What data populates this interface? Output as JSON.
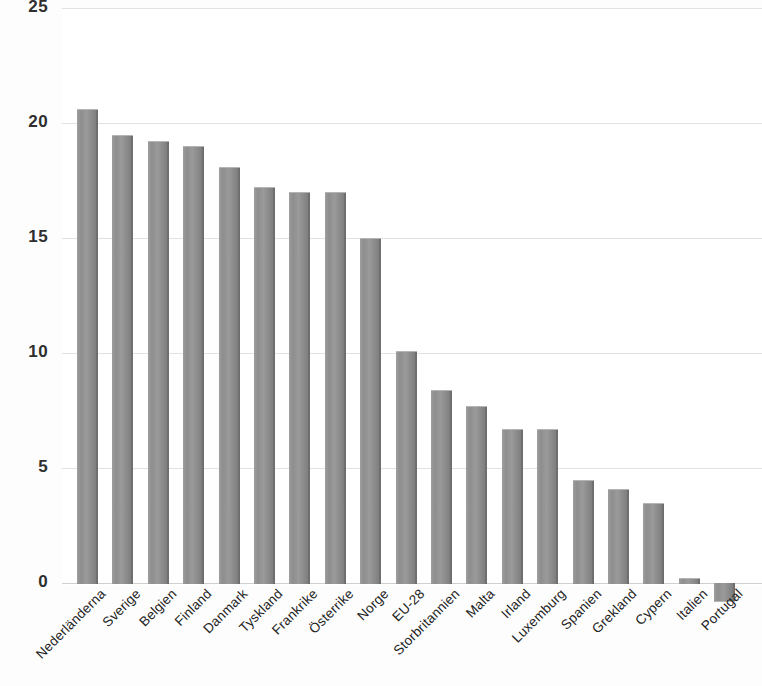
{
  "chart_data": {
    "type": "bar",
    "title": "",
    "subtitle": "",
    "xlabel": "",
    "ylabel": "",
    "ylim": [
      -2.5,
      25
    ],
    "yticks": [
      0,
      5,
      10,
      15,
      20,
      25
    ],
    "ytick_labels": [
      "0",
      "5",
      "10",
      "15",
      "20",
      "25"
    ],
    "grid": true,
    "legend": false,
    "legend_position": "none",
    "bar_color": "#8e8e8e",
    "gridline_color": "#e2e2e2",
    "categories": [
      "Nederländerna",
      "Sverige",
      "Belgien",
      "Finland",
      "Danmark",
      "Tyskland",
      "Frankrike",
      "Österrike",
      "Norge",
      "EU-28",
      "Storbritannien",
      "Malta",
      "Irland",
      "Luxemburg",
      "Spanien",
      "Grekland",
      "Cypern",
      "Italien",
      "Portugal"
    ],
    "values": [
      20.6,
      19.5,
      19.2,
      19.0,
      18.1,
      17.2,
      17.0,
      17.0,
      15.0,
      10.1,
      8.4,
      7.7,
      6.7,
      6.7,
      4.5,
      4.1,
      3.5,
      0.2,
      -0.8
    ]
  }
}
